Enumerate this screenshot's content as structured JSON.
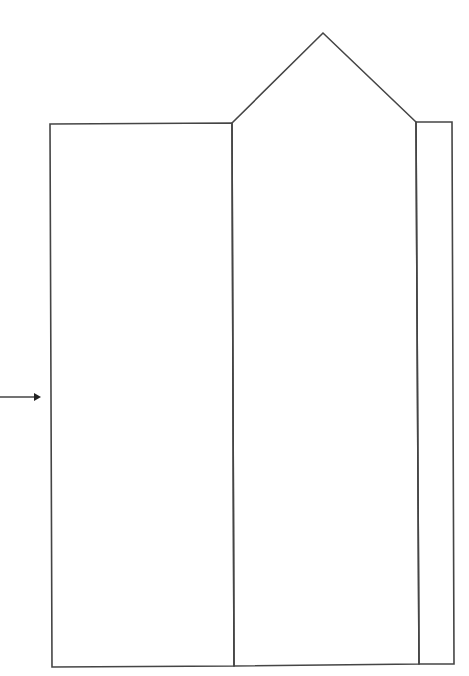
{
  "diagram": {
    "type": "line-drawing template",
    "colors": {
      "background": "#ffffff",
      "line": "#454545"
    },
    "stroke_width": 1.6,
    "panels": [
      {
        "id": "left-panel",
        "points": [
          [
            50,
            124
          ],
          [
            232,
            123
          ],
          [
            234,
            666
          ],
          [
            52,
            667
          ]
        ]
      },
      {
        "id": "center-panel",
        "points": [
          [
            232,
            123
          ],
          [
            323,
            33
          ],
          [
            416,
            122
          ],
          [
            419,
            664
          ],
          [
            234,
            666
          ]
        ]
      },
      {
        "id": "right-strip",
        "points": [
          [
            416,
            122
          ],
          [
            452,
            122
          ],
          [
            454,
            664
          ],
          [
            419,
            664
          ]
        ]
      }
    ],
    "arrow": {
      "from": [
        0,
        397
      ],
      "to": [
        41,
        397
      ],
      "direction": "right"
    }
  }
}
